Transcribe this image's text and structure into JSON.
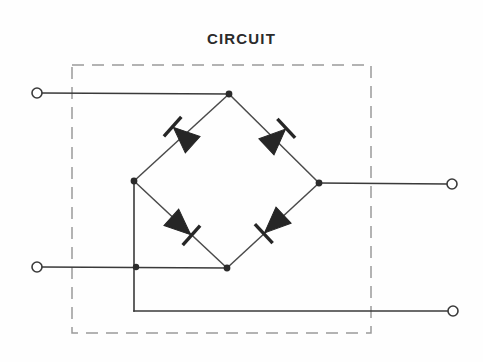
{
  "diagram": {
    "title": "CIRCUIT",
    "type": "full-wave bridge rectifier",
    "background_color": "#fefefe",
    "wire_color": "#3a3a3a",
    "enclosure_color": "#9a9a9a",
    "diode_color": "#262626",
    "enclosure": {
      "label": "circuit-boundary",
      "style": "dashed",
      "x": 72,
      "y": 65,
      "width": 299,
      "height": 268,
      "dash": "12 8"
    },
    "terminals": [
      {
        "name": "input-terminal-top-left",
        "cx": 37,
        "cy": 93,
        "r": 5
      },
      {
        "name": "input-terminal-bottom-left",
        "cx": 37,
        "cy": 267,
        "r": 5
      },
      {
        "name": "output-terminal-right",
        "cx": 452,
        "cy": 184,
        "r": 5
      },
      {
        "name": "output-terminal-bottom-right",
        "cx": 453,
        "cy": 311,
        "r": 5
      }
    ],
    "bridge_nodes": [
      {
        "name": "bridge-node-top",
        "x": 229,
        "y": 94,
        "r": 3.4
      },
      {
        "name": "bridge-node-left",
        "x": 134,
        "y": 181,
        "r": 3.4
      },
      {
        "name": "bridge-node-right",
        "x": 319,
        "y": 183,
        "r": 3.4
      },
      {
        "name": "bridge-node-bottom",
        "x": 227,
        "y": 268,
        "r": 3.4
      }
    ],
    "junction_dots": [
      {
        "name": "junction-bottom-left-rail",
        "x": 136,
        "y": 267,
        "r": 3.2
      }
    ],
    "diodes": [
      {
        "name": "diode-top-left",
        "cx": 183,
        "cy": 136,
        "angle": 225,
        "arrow_direction": "down-left"
      },
      {
        "name": "diode-top-right",
        "cx": 276,
        "cy": 138,
        "angle": 135,
        "arrow_direction": "down-right"
      },
      {
        "name": "diode-bottom-left",
        "cx": 181,
        "cy": 226,
        "angle": 45,
        "arrow_direction": "down-right"
      },
      {
        "name": "diode-bottom-right",
        "cx": 274,
        "cy": 224,
        "angle": 315,
        "arrow_direction": "down-left"
      }
    ],
    "wires": [
      {
        "name": "wire-top-input",
        "path": "M 42 93 L 229 94"
      },
      {
        "name": "wire-bottom-input",
        "path": "M 42 267 L 227 268"
      },
      {
        "name": "wire-right-output",
        "path": "M 319 183 L 447 184"
      },
      {
        "name": "wire-left-rail-vertical",
        "path": "M 134 181 L 134 311"
      },
      {
        "name": "wire-bottom-output",
        "path": "M 134 311 L 448 311"
      },
      {
        "name": "bridge-edge-top-left",
        "path": "M 229 94 L 134 181"
      },
      {
        "name": "bridge-edge-top-right",
        "path": "M 229 94 L 319 183"
      },
      {
        "name": "bridge-edge-bottom-left",
        "path": "M 134 181 L 227 268"
      },
      {
        "name": "bridge-edge-bottom-right",
        "path": "M 319 183 L 227 268"
      }
    ]
  }
}
